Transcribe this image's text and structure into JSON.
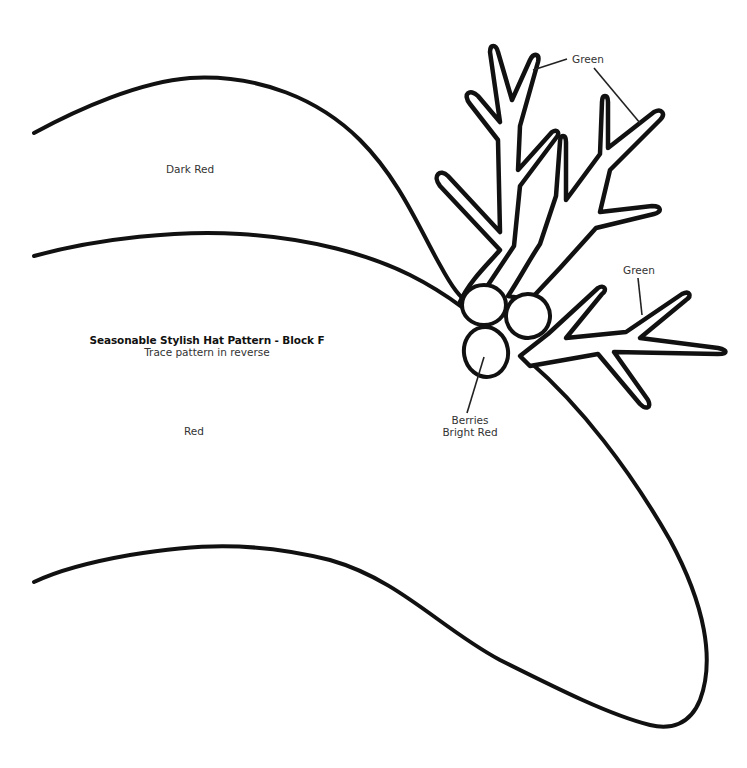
{
  "pattern": {
    "title": "Seasonable Stylish Hat Pattern - Block F",
    "subtitle": "Trace pattern in reverse"
  },
  "regions": {
    "upper_band": "Dark Red",
    "lower_band": "Red"
  },
  "callouts": {
    "green_top": "Green",
    "green_right": "Green",
    "berries_line1": "Berries",
    "berries_line2": "Bright Red"
  },
  "colors": {
    "line": "#111111",
    "background": "#ffffff"
  }
}
